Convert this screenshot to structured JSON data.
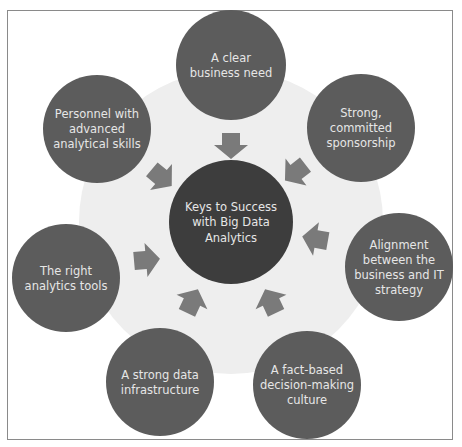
{
  "diagram": {
    "center": {
      "label_lines": [
        "Keys to Success",
        "with Big Data",
        "Analytics"
      ],
      "cx": 231,
      "cy": 222,
      "r": 62
    },
    "nodes": [
      {
        "id": "clear-business-need",
        "label_lines": [
          "A clear",
          "business need"
        ],
        "cx": 231,
        "cy": 65,
        "r": 55
      },
      {
        "id": "sponsorship",
        "label_lines": [
          "Strong,",
          "committed",
          "sponsorship"
        ],
        "cx": 361,
        "cy": 128,
        "r": 54
      },
      {
        "id": "alignment",
        "label_lines": [
          "Alignment",
          "between the",
          "business and IT",
          "strategy"
        ],
        "cx": 399,
        "cy": 267,
        "r": 54
      },
      {
        "id": "fact-based-culture",
        "label_lines": [
          "A fact-based",
          "decision-making",
          "culture"
        ],
        "cx": 307,
        "cy": 385,
        "r": 54
      },
      {
        "id": "data-infrastructure",
        "label_lines": [
          "A strong data",
          "infrastructure"
        ],
        "cx": 160,
        "cy": 382,
        "r": 54
      },
      {
        "id": "analytics-tools",
        "label_lines": [
          "The right",
          "analytics tools"
        ],
        "cx": 66,
        "cy": 278,
        "r": 54
      },
      {
        "id": "analytical-skills",
        "label_lines": [
          "Personnel with",
          "advanced",
          "analytical skills"
        ],
        "cx": 97,
        "cy": 129,
        "r": 54
      }
    ],
    "arrows": [
      {
        "id": "arrow-from-top",
        "x": 231,
        "y": 145,
        "angle": 0
      },
      {
        "id": "arrow-from-top-right",
        "x": 296,
        "y": 172,
        "angle": 52
      },
      {
        "id": "arrow-from-right",
        "x": 316,
        "y": 239,
        "angle": 100
      },
      {
        "id": "arrow-from-bottom-right",
        "x": 271,
        "y": 302,
        "angle": 155
      },
      {
        "id": "arrow-from-bottom-left",
        "x": 192,
        "y": 302,
        "angle": 205
      },
      {
        "id": "arrow-from-left",
        "x": 146,
        "y": 260,
        "angle": 265
      },
      {
        "id": "arrow-from-top-left",
        "x": 161,
        "y": 177,
        "angle": 310
      }
    ],
    "colors": {
      "frame_border": "#8a8a8a",
      "background_ring": "#eeeeee",
      "node_fill": "#5c5c5c",
      "center_fill": "#3d3d3d",
      "arrow_fill": "#7a7a7a",
      "text": "#e6e6e6"
    }
  }
}
